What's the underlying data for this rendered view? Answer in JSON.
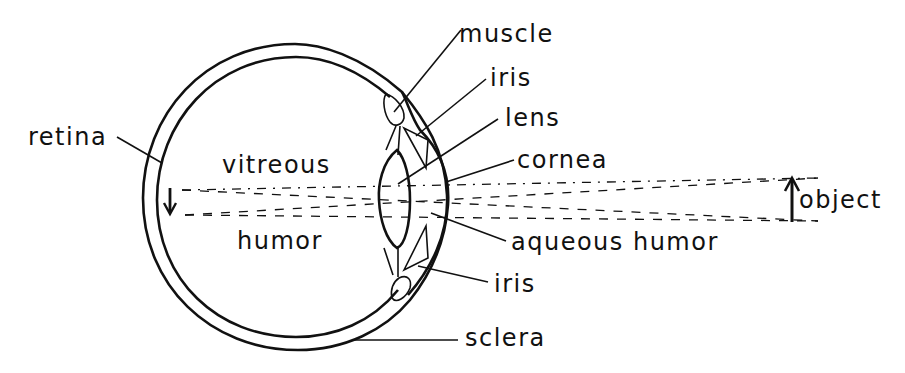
{
  "diagram": {
    "labels": {
      "muscle": "muscle",
      "iris_top": "iris",
      "lens": "lens",
      "cornea": "cornea",
      "retina": "retina",
      "vitreous": "vitreous",
      "humor": "humor",
      "aqueous_humor": "aqueous humor",
      "iris_bottom": "iris",
      "sclera": "sclera",
      "object": "object"
    },
    "arrows": {
      "image": "down-arrow (inverted image on retina)",
      "object": "up-arrow (upright object)"
    },
    "colors": {
      "ink": "#111111",
      "background": "#ffffff"
    }
  }
}
